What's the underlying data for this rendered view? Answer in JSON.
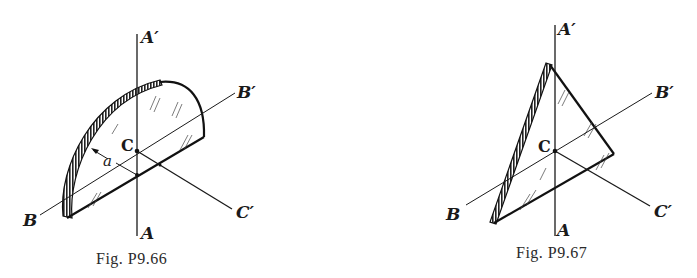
{
  "figures": [
    {
      "id": "P9.66",
      "caption": "Fig. P9.66",
      "shape": "semicircular disk",
      "labels": {
        "a_prime": "A′",
        "a": "A",
        "b": "B",
        "b_prime": "B′",
        "c": "C",
        "c_prime": "C′",
        "radius": "a"
      }
    },
    {
      "id": "P9.67",
      "caption": "Fig. P9.67",
      "shape": "triangular plate",
      "labels": {
        "a_prime": "A′",
        "a": "A",
        "b": "B",
        "b_prime": "B′",
        "c": "C",
        "c_prime": "C′"
      }
    }
  ],
  "colors": {
    "ink": "#1a1a1a",
    "background": "#ffffff"
  }
}
